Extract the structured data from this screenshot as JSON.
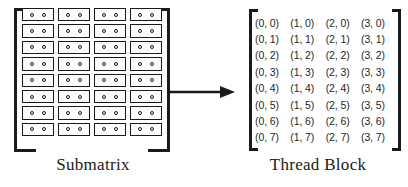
{
  "figure": {
    "ink_color": "#1a1a1a",
    "background_color": "#ffffff"
  },
  "submatrix": {
    "caption": "Submatrix",
    "rows": 8,
    "columns": 4,
    "dots_per_cell": 2,
    "bracket_style": "corner-brackets",
    "cell_label": "memory-element"
  },
  "arrow": {
    "icon": "arrow-right-icon",
    "direction": "right",
    "label": ""
  },
  "thread_block": {
    "caption": "Thread Block",
    "bracket_style": "square-brackets",
    "rows": [
      [
        "(0, 0)",
        "(1, 0)",
        "(2, 0)",
        "(3, 0)"
      ],
      [
        "(0, 1)",
        "(1, 1)",
        "(2, 1)",
        "(3, 1)"
      ],
      [
        "(0, 2)",
        "(1, 2)",
        "(2, 2)",
        "(3, 2)"
      ],
      [
        "(0, 3)",
        "(1, 3)",
        "(2, 3)",
        "(3, 3)"
      ],
      [
        "(0, 4)",
        "(1, 4)",
        "(2, 4)",
        "(3, 4)"
      ],
      [
        "(0, 5)",
        "(1, 5)",
        "(2, 5)",
        "(3, 5)"
      ],
      [
        "(0, 6)",
        "(1, 6)",
        "(2, 6)",
        "(3, 6)"
      ],
      [
        "(0, 7)",
        "(1, 7)",
        "(2, 7)",
        "(3, 7)"
      ]
    ]
  }
}
